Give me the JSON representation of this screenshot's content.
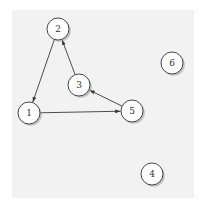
{
  "diagram": {
    "type": "directed-graph",
    "colors": {
      "background": "#f2f2f2",
      "edge": "#3a3a3a",
      "node_fill": "#ffffff",
      "node_stroke": "#333333"
    },
    "nodes": [
      {
        "id": "1",
        "label": "1",
        "x": 29,
        "y": 113
      },
      {
        "id": "2",
        "label": "2",
        "x": 58,
        "y": 29
      },
      {
        "id": "3",
        "label": "3",
        "x": 79,
        "y": 85
      },
      {
        "id": "4",
        "label": "4",
        "x": 152,
        "y": 174
      },
      {
        "id": "5",
        "label": "5",
        "x": 132,
        "y": 111
      },
      {
        "id": "6",
        "label": "6",
        "x": 172,
        "y": 63
      }
    ],
    "edges": [
      {
        "from": "2",
        "to": "1"
      },
      {
        "from": "3",
        "to": "2"
      },
      {
        "from": "5",
        "to": "3"
      },
      {
        "from": "1",
        "to": "5"
      }
    ]
  }
}
